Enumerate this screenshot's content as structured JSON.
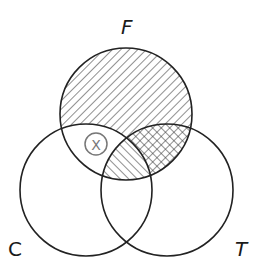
{
  "diagram": {
    "type": "venn-3-set",
    "sets": [
      {
        "id": "F",
        "label": "F",
        "position": "top"
      },
      {
        "id": "C",
        "label": "C",
        "position": "bottom-left"
      },
      {
        "id": "T",
        "label": "T",
        "position": "bottom-right"
      }
    ],
    "regions": [
      {
        "region": "F only",
        "shading": "diagonal-hatch-forward"
      },
      {
        "region": "F and C, not T",
        "shading": "none",
        "marker": "X"
      },
      {
        "region": "F and C and T",
        "shading": "diagonal-hatch-backward"
      },
      {
        "region": "F and T, not C",
        "shading": "cross-hatch"
      },
      {
        "region": "C only",
        "shading": "none"
      },
      {
        "region": "T only",
        "shading": "none"
      },
      {
        "region": "C and T, not F",
        "shading": "none"
      }
    ],
    "marker": {
      "symbol": "X",
      "style": "circled",
      "color": "#777777"
    },
    "colors": {
      "outline": "#222222",
      "hatch": "#333333",
      "background": "#ffffff"
    }
  }
}
